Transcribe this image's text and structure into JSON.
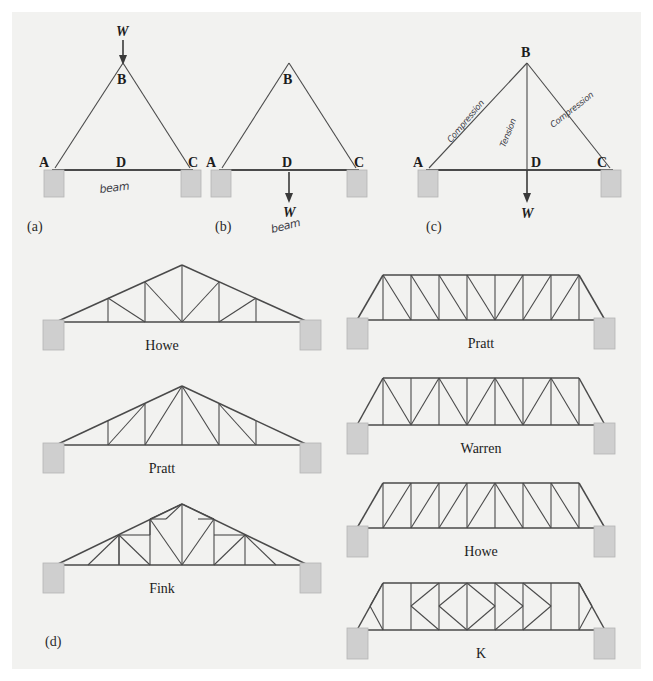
{
  "figure": {
    "background_color": "#f2f2f0",
    "page_color": "#ffffff",
    "member_color": "#4a4a4a",
    "support_color": "#cfcfcf"
  },
  "panels": [
    {
      "tag": "(a)",
      "nodes": {
        "a": "A",
        "b": "B",
        "c": "C",
        "d": "D"
      },
      "load_label": "W",
      "annotation": "beam"
    },
    {
      "tag": "(b)",
      "nodes": {
        "a": "A",
        "b": "B",
        "c": "C",
        "d": "D"
      },
      "load_label": "W",
      "annotation": "beam"
    },
    {
      "tag": "(c)",
      "nodes": {
        "a": "A",
        "b": "B",
        "c": "C",
        "d": "D"
      },
      "load_label": "W",
      "annotations": {
        "left_member": "Compression",
        "center_member": "Tension",
        "right_member": "Compression"
      }
    },
    {
      "tag": "(d)"
    }
  ],
  "roof_trusses": [
    {
      "name": "Howe"
    },
    {
      "name": "Pratt"
    },
    {
      "name": "Fink"
    }
  ],
  "bridge_trusses": [
    {
      "name": "Pratt"
    },
    {
      "name": "Warren"
    },
    {
      "name": "Howe"
    },
    {
      "name": "K"
    }
  ]
}
